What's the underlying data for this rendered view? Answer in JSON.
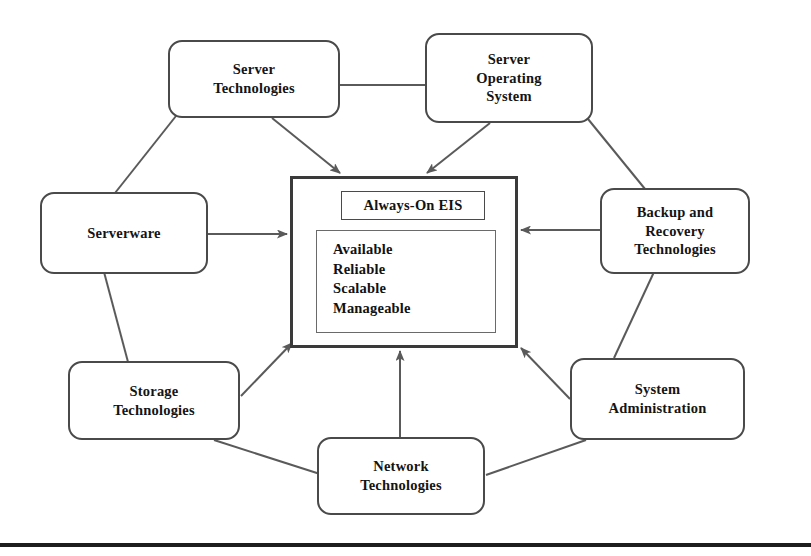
{
  "diagram": {
    "center": {
      "title": "Always-On EIS",
      "attributes": [
        "Available",
        "Reliable",
        "Scalable",
        "Manageable"
      ]
    },
    "nodes": [
      {
        "id": "server-technologies",
        "label": "Server\nTechnologies"
      },
      {
        "id": "server-operating-system",
        "label": "Server\nOperating\nSystem"
      },
      {
        "id": "serverware",
        "label": "Serverware"
      },
      {
        "id": "backup-and-recovery-technologies",
        "label": "Backup and\nRecovery\nTechnologies"
      },
      {
        "id": "storage-technologies",
        "label": "Storage\nTechnologies"
      },
      {
        "id": "system-administration",
        "label": "System\nAdministration"
      },
      {
        "id": "network-technologies",
        "label": "Network\nTechnologies"
      }
    ],
    "colors": {
      "node_border": "#4a4a4a",
      "center_border": "#3a3a3a",
      "connector": "#5a5a5a",
      "text": "#141414",
      "background": "#ffffff",
      "rule": "#1d1d1d"
    }
  }
}
